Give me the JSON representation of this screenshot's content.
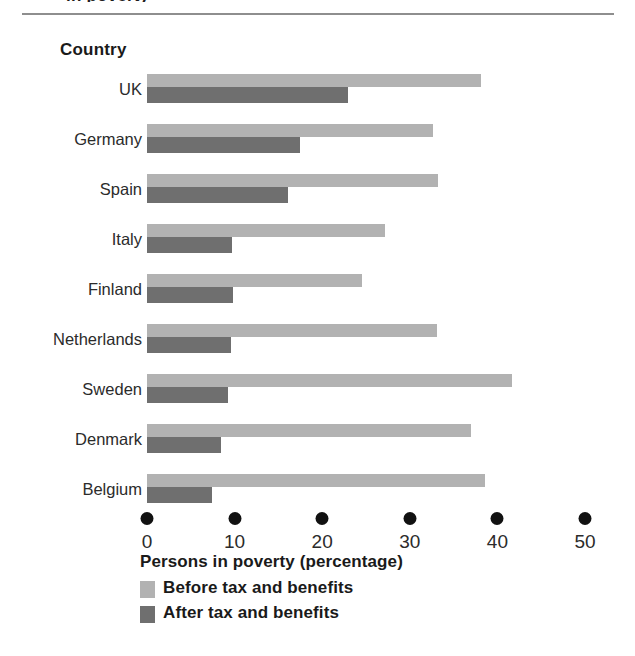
{
  "page": {
    "title_remnant": "in poverty",
    "heading": "Country"
  },
  "chart_data": {
    "type": "bar",
    "orientation": "horizontal",
    "title": "",
    "xlabel": "Persons in poverty (percentage)",
    "ylabel": "Country",
    "xlim": [
      0,
      50
    ],
    "xticks": [
      0,
      10,
      20,
      30,
      40,
      50
    ],
    "xtick_labels": [
      "0",
      "10",
      "20",
      "30",
      "40",
      "50"
    ],
    "grid": false,
    "legend_position": "bottom-left",
    "categories": [
      "UK",
      "Germany",
      "Spain",
      "Italy",
      "Finland",
      "Netherlands",
      "Sweden",
      "Denmark",
      "Belgium"
    ],
    "series": [
      {
        "name": "Before tax and benefits",
        "color": "#b2b2b2",
        "values": [
          38.1,
          32.6,
          33.2,
          27.2,
          24.5,
          33.1,
          41.7,
          37.0,
          38.6
        ]
      },
      {
        "name": "After tax and benefits",
        "color": "#6f6f6f",
        "values": [
          22.9,
          17.5,
          16.1,
          9.7,
          9.8,
          9.6,
          9.2,
          8.4,
          7.4
        ]
      }
    ]
  },
  "legend": [
    {
      "label": "Before tax and benefits",
      "color": "#b2b2b2"
    },
    {
      "label": "After tax and benefits",
      "color": "#6f6f6f"
    }
  ],
  "colors": {
    "before": "#b2b2b2",
    "after": "#6f6f6f",
    "tick": "#111111",
    "rule": "#8e8e8e",
    "text": "#1a1a1a",
    "background": "#ffffff"
  }
}
